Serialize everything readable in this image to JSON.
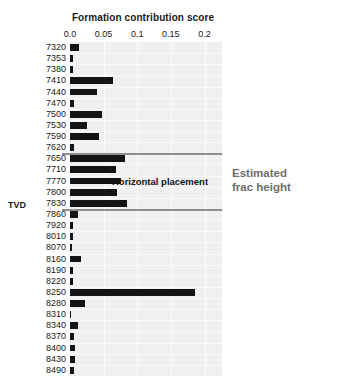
{
  "chart_data": {
    "type": "bar",
    "orientation": "horizontal",
    "title": "Formation contribution score",
    "xlabel": "",
    "ylabel": "TVD",
    "xlim": [
      0.0,
      0.226
    ],
    "ylim": null,
    "grid": true,
    "legend_position": "none",
    "xticks": [
      0.0,
      0.05,
      0.1,
      0.15,
      0.2
    ],
    "xtick_labels": [
      "0.0",
      "0.05",
      "0.1",
      "0.15",
      "0.2"
    ],
    "categories": [
      "7320",
      "7353",
      "7380",
      "7410",
      "7440",
      "7470",
      "7500",
      "7530",
      "7590",
      "7620",
      "7650",
      "7710",
      "7770",
      "7800",
      "7830",
      "7860",
      "7920",
      "8010",
      "8070",
      "8160",
      "8190",
      "8220",
      "8250",
      "8280",
      "8310",
      "8340",
      "8370",
      "8400",
      "8430",
      "8490"
    ],
    "values": [
      0.013,
      0.005,
      0.005,
      0.064,
      0.04,
      0.006,
      0.047,
      0.026,
      0.043,
      0.006,
      0.082,
      0.069,
      0.076,
      0.07,
      0.085,
      0.012,
      0.005,
      0.004,
      0.003,
      0.016,
      0.004,
      0.005,
      0.186,
      0.022,
      0.001,
      0.012,
      0.006,
      0.007,
      0.008,
      0.006
    ],
    "annotations": [
      {
        "name": "horizontal-placement",
        "text": "Horizontal placement",
        "category": "7770"
      },
      {
        "name": "estimated-frac-height",
        "text_line1": "Estimated",
        "text_line2": "frac height",
        "span_categories": [
          "7650",
          "7830"
        ]
      }
    ],
    "colors": {
      "bar": "#141414",
      "panel_background": "#f0f0f0",
      "gridline": "#fdfdfd",
      "annotation_line": "#8e8e8e",
      "annotation_text": "#6e6e6e",
      "text": "#1a1a1a"
    }
  },
  "labels": {
    "title": "Formation contribution score",
    "yaxis_title": "TVD",
    "horizontal_placement": "Horizontal placement",
    "frac_line1": "Estimated",
    "frac_line2": "frac height"
  }
}
